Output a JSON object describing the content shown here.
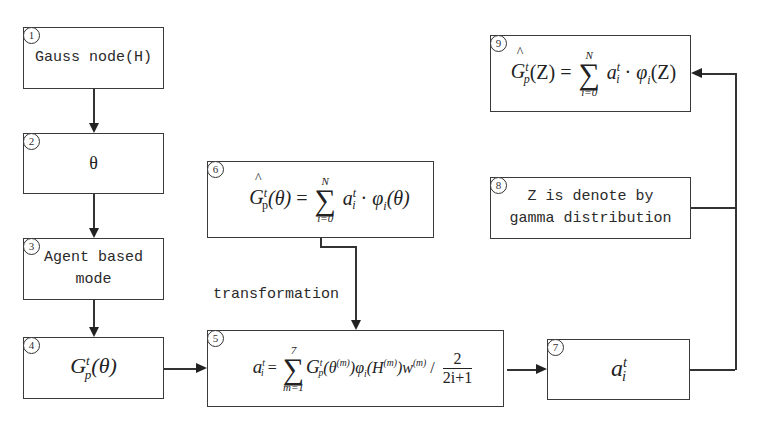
{
  "nodes": {
    "n1": {
      "number": "1",
      "text": "Gauss node(H)"
    },
    "n2": {
      "number": "2",
      "text": "θ"
    },
    "n3": {
      "number": "3",
      "line1": "Agent based",
      "line2": "mode"
    },
    "n4": {
      "number": "4",
      "G": "G",
      "sup": "t",
      "sub": "p",
      "arg": "(θ)"
    },
    "n5": {
      "number": "5",
      "lhs_a": "a",
      "lhs_sup": "t",
      "lhs_sub": "i",
      "eq": "=",
      "sum_top": "7",
      "sum_bottom": "m=1",
      "body": "G",
      "body_sup": "t",
      "body_sub": "p",
      "body_arg": "(θ",
      "m_sup": "(m)",
      "phi": ")φ",
      "phi_sub": "i",
      "h_arg": "(H",
      "w": ")w",
      "div": " /",
      "num": "2",
      "den": "2i+1"
    },
    "n6": {
      "number": "6",
      "G": "G",
      "sup": "t",
      "sub": "p",
      "arg": "(θ)",
      "eq": "=",
      "sum_top": "N",
      "sum_bottom": "i=0",
      "a": "a",
      "a_sup": "t",
      "a_sub": "i",
      "dot": "·",
      "phi": "φ",
      "phi_sub": "i",
      "phi_arg": "(θ)"
    },
    "n7": {
      "number": "7",
      "a": "a",
      "sup": "t",
      "sub": "i"
    },
    "n8": {
      "number": "8",
      "line1": "Z is denote by",
      "line2": "gamma distribution"
    },
    "n9": {
      "number": "9",
      "G": "G",
      "sup": "t",
      "sub": "p",
      "arg": "(Z)",
      "eq": "=",
      "sum_top": "N",
      "sum_bottom": "i=0",
      "a": "a",
      "a_sup": "t",
      "a_sub": "i",
      "dot": "·",
      "phi": "φ",
      "phi_sub": "i",
      "phi_arg": "(Z)"
    }
  },
  "edge_labels": {
    "transformation": "transformation"
  }
}
